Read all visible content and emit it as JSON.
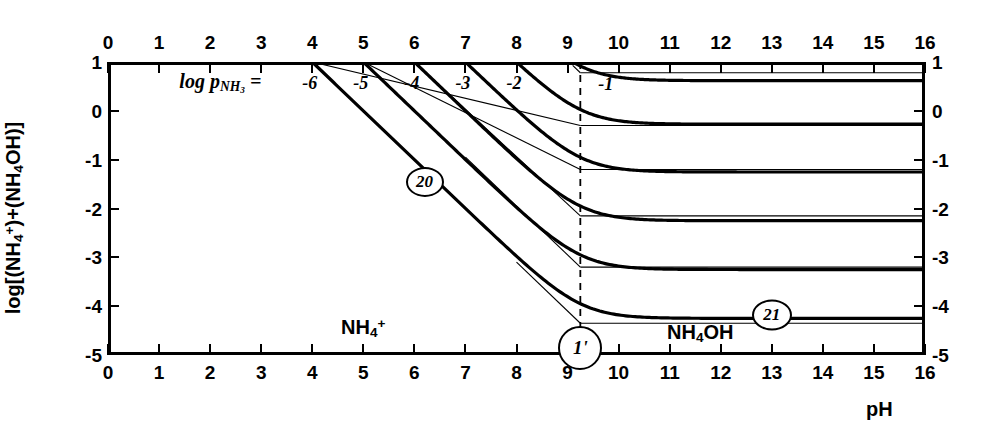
{
  "chart_data": {
    "type": "line",
    "title": "",
    "xlabel": "pH",
    "ylabel": "log[(NH4+)+(NH4OH)]",
    "xlim": [
      0,
      16
    ],
    "ylim": [
      -5,
      1
    ],
    "xticks": [
      0,
      1,
      2,
      3,
      4,
      5,
      6,
      7,
      8,
      9,
      10,
      11,
      12,
      13,
      14,
      15,
      16
    ],
    "yticks": [
      1,
      0,
      -1,
      -2,
      -3,
      -4,
      -5
    ],
    "xtick_labels": [
      "0",
      "1",
      "2",
      "3",
      "4",
      "5",
      "6",
      "7",
      "8",
      "9",
      "10",
      "11",
      "12",
      "13",
      "14",
      "15",
      "16"
    ],
    "ytick_labels": [
      "1",
      "0",
      "-1",
      "-2",
      "-3",
      "-4",
      "-5"
    ],
    "grid": false,
    "legend_position": "in-plot-curve-labels",
    "annotations": [
      {
        "name": "parameter-equation",
        "text": "log p",
        "sub": "NH",
        "sub2": "3",
        "full": "log p_NH3 =",
        "x": 2.2,
        "y": 0.58
      },
      {
        "name": "species-left",
        "text": "NH4+",
        "x": 5.0,
        "y": -4.45
      },
      {
        "name": "species-right",
        "text": "NH4OH",
        "x": 11.6,
        "y": -4.55
      },
      {
        "name": "ref-20",
        "text": "20",
        "x": 6.2,
        "y": -1.45
      },
      {
        "name": "ref-21",
        "text": "21",
        "x": 13.0,
        "y": -4.18
      },
      {
        "name": "ref-1prime",
        "text": "1'",
        "x": 9.25,
        "y": -4.85
      }
    ],
    "vertical_dashed_line": {
      "name": "pKa-line",
      "x": 9.25,
      "label": "9.25"
    },
    "series": [
      {
        "name": "logpNH3 = -6",
        "label": "-6",
        "label_x": 3.95,
        "label_y": 0.56,
        "plateau": -0.3,
        "break_x": 9.25,
        "start_x": 4.0,
        "start_y": 1.0
      },
      {
        "name": "logpNH3 = -5",
        "label": "-5",
        "label_x": 4.95,
        "label_y": 0.56,
        "plateau": -1.2,
        "break_x": 9.25,
        "start_x": 5.0,
        "start_y": 1.0
      },
      {
        "name": "logpNH3 = -4",
        "label": "-4",
        "label_x": 5.95,
        "label_y": 0.56,
        "plateau": -2.15,
        "break_x": 9.25,
        "start_x": 6.0,
        "start_y": 1.0
      },
      {
        "name": "logpNH3 = -3",
        "label": "-3",
        "label_x": 6.95,
        "label_y": 0.56,
        "plateau": -3.2,
        "break_x": 9.25,
        "start_x": 7.0,
        "start_y": 1.0
      },
      {
        "name": "logpNH3 = -2",
        "label": "-2",
        "label_x": 7.95,
        "label_y": 0.56,
        "plateau": -4.35,
        "break_x": 9.25,
        "start_x": 8.0,
        "start_y": 1.0
      },
      {
        "name": "logpNH3 = -1",
        "label": "-1",
        "label_x": 9.75,
        "label_y": 0.55,
        "plateau": 0.78,
        "break_x": 9.25,
        "start_x": 9.1,
        "start_y": 1.0
      }
    ]
  },
  "axes": {
    "x_title": "pH",
    "y_title_parts": {
      "prefix": "log[(NH",
      "sub1": "4",
      "sup1": "+",
      "mid": ")+(NH",
      "sub2": "4",
      "suffix": "OH)]"
    }
  },
  "annotation_text": {
    "equation_prefix": "log p",
    "equation_sub": "NH",
    "equation_sub_num": "3",
    "equation_eq": "=",
    "species_left_base": "NH",
    "species_left_sub": "4",
    "species_left_sup": "+",
    "species_right": "NH",
    "species_right_sub": "4",
    "species_right_rest": "OH",
    "ref_20": "20",
    "ref_21": "21",
    "ref_1prime": "1'"
  },
  "colors": {
    "axis": "#000000",
    "curve": "#000000",
    "background": "#ffffff",
    "dashed": "#000000"
  }
}
